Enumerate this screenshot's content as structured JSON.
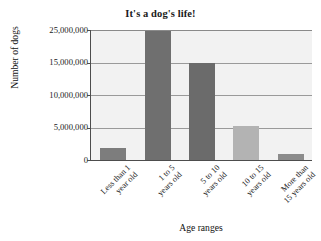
{
  "chart_data": {
    "type": "bar",
    "title": "It's a dog's life!",
    "xlabel": "Age ranges",
    "ylabel": "Number of dogs",
    "categories": [
      "Less than 1 year old",
      "1 to 5 years old",
      "5 to 10 years old",
      "10 to 15 years old",
      "More than 15 years old"
    ],
    "category_lines": [
      [
        "Less than 1",
        "year old"
      ],
      [
        "1 to 5",
        "years old"
      ],
      [
        "5 to 10",
        "years old"
      ],
      [
        "10 to 15",
        "years old"
      ],
      [
        "More than",
        "15 years old"
      ]
    ],
    "values": [
      2300000,
      24800000,
      18700000,
      6500000,
      1100000
    ],
    "bar_colors": [
      "#7d7d7d",
      "#6f6f6f",
      "#6b6b6b",
      "#b3b3b3",
      "#8c8c8c"
    ],
    "ytick_labels": [
      "25,000,000",
      "15,000,000",
      "10,000,000",
      "5,000,000",
      "0"
    ],
    "ytick_values": [
      25000000,
      15000000,
      10000000,
      5000000,
      0
    ],
    "ytick_positions_px": [
      0,
      32.5,
      65,
      97.5,
      130
    ],
    "ylim": [
      0,
      25000000
    ],
    "grid": true,
    "legend": "none",
    "plot_background": "#f2f2f2",
    "axis_color": "#4d4d4d",
    "grid_color": "#9a9a9a"
  }
}
